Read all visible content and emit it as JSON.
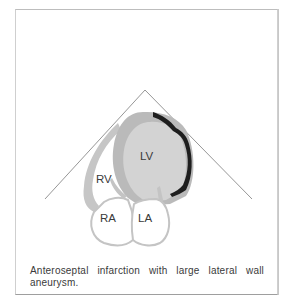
{
  "figure": {
    "labels": {
      "lv": "LV",
      "rv": "RV",
      "ra": "RA",
      "la": "LA"
    },
    "caption": "Anteroseptal infarction with large lateral wall aneurysm.",
    "colors": {
      "myocardium": "#b9b9b9",
      "cavity": "#d2d2d2",
      "aneurysm": "#1e1e1e",
      "atria_fill": "#ffffff",
      "outline": "#c4c4c4",
      "sector_lines": "#8a8a8a"
    }
  }
}
